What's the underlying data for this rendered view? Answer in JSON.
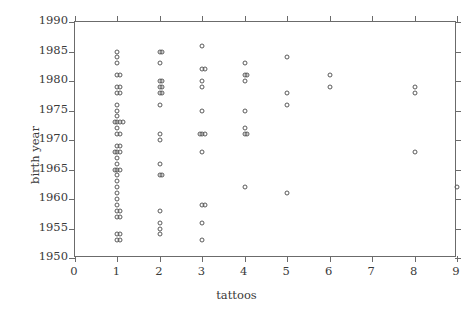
{
  "chart_data": {
    "type": "scatter",
    "title": "",
    "xlabel": "tattoos",
    "ylabel": "birth year",
    "xlim": [
      0,
      9
    ],
    "ylim": [
      1950,
      1990
    ],
    "grid": false,
    "legend": null,
    "xticks": [
      "0",
      "1",
      "2",
      "3",
      "4",
      "5",
      "6",
      "7",
      "8",
      "9"
    ],
    "yticks": [
      "1950",
      "1955",
      "1960",
      "1965",
      "1970",
      "1975",
      "1980",
      "1985",
      "1990"
    ],
    "xtick_values": [
      0,
      1,
      2,
      3,
      4,
      5,
      6,
      7,
      8,
      9
    ],
    "ytick_values": [
      1950,
      1955,
      1960,
      1965,
      1970,
      1975,
      1980,
      1985,
      1990
    ],
    "marker": "open-circle",
    "marker_color": "#5a5a5a",
    "points": [
      {
        "x": 1,
        "y": 1985
      },
      {
        "x": 1,
        "y": 1984
      },
      {
        "x": 1,
        "y": 1983
      },
      {
        "x": 1,
        "y": 1981
      },
      {
        "x": 1,
        "y": 1981
      },
      {
        "x": 1,
        "y": 1979
      },
      {
        "x": 1,
        "y": 1979
      },
      {
        "x": 1,
        "y": 1978
      },
      {
        "x": 1,
        "y": 1978
      },
      {
        "x": 1,
        "y": 1976
      },
      {
        "x": 1,
        "y": 1975
      },
      {
        "x": 1,
        "y": 1974
      },
      {
        "x": 1,
        "y": 1973
      },
      {
        "x": 1,
        "y": 1973
      },
      {
        "x": 1,
        "y": 1973
      },
      {
        "x": 1,
        "y": 1973
      },
      {
        "x": 1,
        "y": 1972
      },
      {
        "x": 1,
        "y": 1971
      },
      {
        "x": 1,
        "y": 1971
      },
      {
        "x": 1,
        "y": 1969
      },
      {
        "x": 1,
        "y": 1969
      },
      {
        "x": 1,
        "y": 1968
      },
      {
        "x": 1,
        "y": 1968
      },
      {
        "x": 1,
        "y": 1968
      },
      {
        "x": 1,
        "y": 1967
      },
      {
        "x": 1,
        "y": 1966
      },
      {
        "x": 1,
        "y": 1965
      },
      {
        "x": 1,
        "y": 1965
      },
      {
        "x": 1,
        "y": 1965
      },
      {
        "x": 1,
        "y": 1964
      },
      {
        "x": 1,
        "y": 1963
      },
      {
        "x": 1,
        "y": 1962
      },
      {
        "x": 1,
        "y": 1961
      },
      {
        "x": 1,
        "y": 1960
      },
      {
        "x": 1,
        "y": 1959
      },
      {
        "x": 1,
        "y": 1958
      },
      {
        "x": 1,
        "y": 1958
      },
      {
        "x": 1,
        "y": 1957
      },
      {
        "x": 1,
        "y": 1957
      },
      {
        "x": 1,
        "y": 1954
      },
      {
        "x": 1,
        "y": 1954
      },
      {
        "x": 1,
        "y": 1953
      },
      {
        "x": 1,
        "y": 1953
      },
      {
        "x": 2,
        "y": 1985
      },
      {
        "x": 2,
        "y": 1985
      },
      {
        "x": 2,
        "y": 1983
      },
      {
        "x": 2,
        "y": 1980
      },
      {
        "x": 2,
        "y": 1980
      },
      {
        "x": 2,
        "y": 1979
      },
      {
        "x": 2,
        "y": 1979
      },
      {
        "x": 2,
        "y": 1978
      },
      {
        "x": 2,
        "y": 1978
      },
      {
        "x": 2,
        "y": 1976
      },
      {
        "x": 2,
        "y": 1971
      },
      {
        "x": 2,
        "y": 1970
      },
      {
        "x": 2,
        "y": 1966
      },
      {
        "x": 2,
        "y": 1964
      },
      {
        "x": 2,
        "y": 1964
      },
      {
        "x": 2,
        "y": 1958
      },
      {
        "x": 2,
        "y": 1956
      },
      {
        "x": 2,
        "y": 1955
      },
      {
        "x": 2,
        "y": 1954
      },
      {
        "x": 3,
        "y": 1986
      },
      {
        "x": 3,
        "y": 1982
      },
      {
        "x": 3,
        "y": 1982
      },
      {
        "x": 3,
        "y": 1980
      },
      {
        "x": 3,
        "y": 1979
      },
      {
        "x": 3,
        "y": 1975
      },
      {
        "x": 3,
        "y": 1971
      },
      {
        "x": 3,
        "y": 1971
      },
      {
        "x": 3,
        "y": 1971
      },
      {
        "x": 3,
        "y": 1968
      },
      {
        "x": 3,
        "y": 1959
      },
      {
        "x": 3,
        "y": 1959
      },
      {
        "x": 3,
        "y": 1956
      },
      {
        "x": 3,
        "y": 1953
      },
      {
        "x": 4,
        "y": 1983
      },
      {
        "x": 4,
        "y": 1981
      },
      {
        "x": 4,
        "y": 1981
      },
      {
        "x": 4,
        "y": 1980
      },
      {
        "x": 4,
        "y": 1975
      },
      {
        "x": 4,
        "y": 1972
      },
      {
        "x": 4,
        "y": 1971
      },
      {
        "x": 4,
        "y": 1971
      },
      {
        "x": 4,
        "y": 1962
      },
      {
        "x": 5,
        "y": 1984
      },
      {
        "x": 5,
        "y": 1978
      },
      {
        "x": 5,
        "y": 1976
      },
      {
        "x": 5,
        "y": 1961
      },
      {
        "x": 6,
        "y": 1981
      },
      {
        "x": 6,
        "y": 1979
      },
      {
        "x": 8,
        "y": 1979
      },
      {
        "x": 8,
        "y": 1978
      },
      {
        "x": 8,
        "y": 1968
      },
      {
        "x": 9,
        "y": 1962
      }
    ]
  }
}
